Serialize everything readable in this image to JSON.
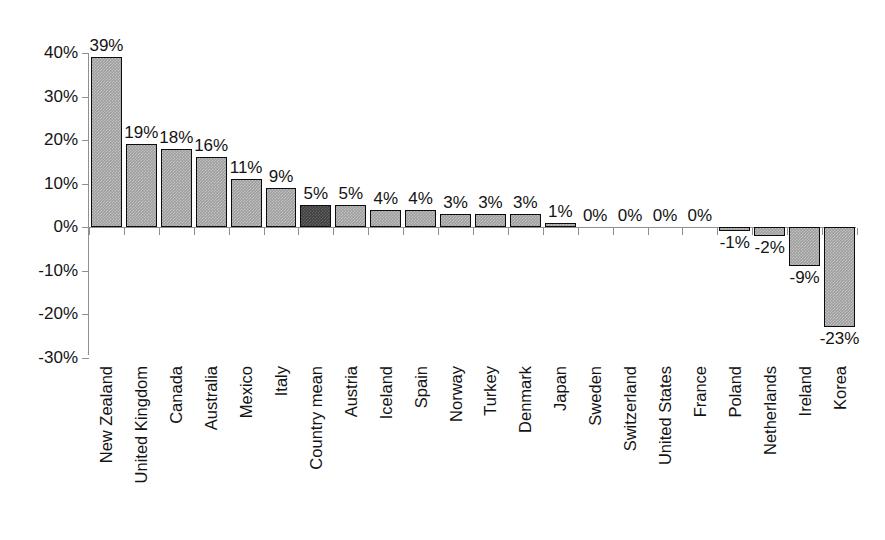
{
  "chart_data": {
    "type": "bar",
    "title": "",
    "subtitle": "",
    "xlabel": "",
    "ylabel": "",
    "ylim": [
      -30,
      40
    ],
    "grid": false,
    "legend": "none",
    "orientation": "vertical",
    "value_label_format": "percent",
    "y_ticks": [
      "40%",
      "30%",
      "20%",
      "10%",
      "0%",
      "-10%",
      "-20%",
      "-30%"
    ],
    "y_tick_values": [
      40,
      30,
      20,
      10,
      0,
      -10,
      -20,
      -30
    ],
    "categories": [
      "New Zealand",
      "United Kingdom",
      "Canada",
      "Australia",
      "Mexico",
      "Italy",
      "Country mean",
      "Austria",
      "Iceland",
      "Spain",
      "Norway",
      "Turkey",
      "Denmark",
      "Japan",
      "Sweden",
      "Switzerland",
      "United States",
      "France",
      "Poland",
      "Netherlands",
      "Ireland",
      "Korea"
    ],
    "values": [
      39,
      19,
      18,
      16,
      11,
      9,
      5,
      5,
      4,
      4,
      3,
      3,
      3,
      1,
      0,
      0,
      0,
      0,
      -1,
      -2,
      -9,
      -23
    ],
    "value_labels": [
      "39%",
      "19%",
      "18%",
      "16%",
      "11%",
      "9%",
      "5%",
      "5%",
      "4%",
      "4%",
      "3%",
      "3%",
      "3%",
      "1%",
      "0%",
      "0%",
      "0%",
      "0%",
      "-1%",
      "-2%",
      "-9%",
      "-23%"
    ],
    "highlight_category": "Country mean",
    "highlight_index": 6,
    "colors": {
      "bar_fill": "#9e9e9e",
      "bar_highlight_fill": "#3f3f3f",
      "bar_border": "#0c0c0c",
      "axis": "#8f8f8f",
      "text": "#131313",
      "background": "#ffffff"
    }
  }
}
